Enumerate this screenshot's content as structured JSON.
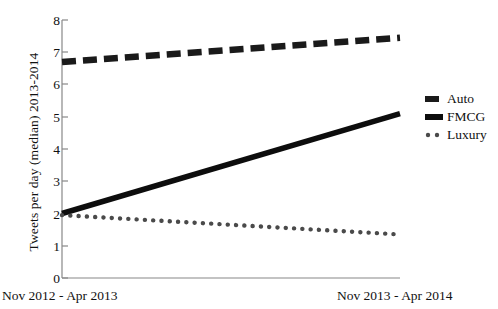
{
  "chart_data": {
    "type": "line",
    "title": "",
    "subtitle": "",
    "xlabel": "",
    "ylabel": "Tweets per day (median) 2013-2014",
    "ylim": [
      0,
      8
    ],
    "yticks": [
      8,
      7,
      6,
      5,
      4,
      3,
      2,
      1,
      0
    ],
    "xtick_labels": [
      "Nov 2012 - Apr 2013",
      "Nov 2013 - Apr 2014"
    ],
    "x": [
      0,
      1
    ],
    "grid": false,
    "legend_position": "right",
    "series": [
      {
        "name": "Auto",
        "style": "dashed",
        "color": "#1a1a1a",
        "values": [
          6.7,
          7.45
        ]
      },
      {
        "name": "FMCG",
        "style": "solid",
        "color": "#0d0d0d",
        "values": [
          2.0,
          5.1
        ]
      },
      {
        "name": "Luxury",
        "style": "dotted",
        "color": "#4a4a4a",
        "values": [
          1.95,
          1.35
        ]
      }
    ]
  },
  "axis": {
    "tick_0": "0",
    "tick_1": "1",
    "tick_2": "2",
    "tick_3": "3",
    "tick_4": "4",
    "tick_5": "5",
    "tick_6": "6",
    "tick_7": "7",
    "tick_8": "8",
    "ylabel": "Tweets per day (median) 2013-2014",
    "xcap_left": "Nov 2012 - Apr 2013",
    "xcap_right": "Nov 2013 - Apr 2014"
  },
  "legend": {
    "items": [
      {
        "label": "Auto",
        "style": "dashed"
      },
      {
        "label": "FMCG",
        "style": "solid"
      },
      {
        "label": "Luxury",
        "style": "dotted"
      }
    ]
  }
}
